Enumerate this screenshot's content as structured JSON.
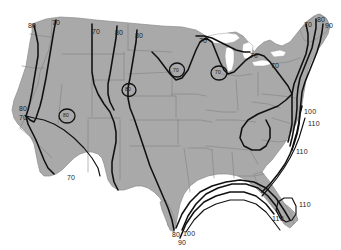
{
  "map": {
    "title": "United States contour map",
    "region": "Contiguous United States",
    "background_color": "#ffffff",
    "land_color": "#a9a9a9",
    "state_border_color": "#7f7f7f",
    "contour_color": "#101010",
    "lake_color": "#ffffff"
  },
  "chart_data": {
    "type": "contour",
    "title": "",
    "xlabel": "",
    "ylabel": "",
    "contour_levels": [
      70,
      80,
      90,
      100,
      110
    ],
    "units": "",
    "legend": [],
    "grid": false,
    "labels": [
      {
        "id": "nw-80",
        "value": "80",
        "x": 28,
        "y": 22,
        "region": "Pacific Northwest coast"
      },
      {
        "id": "nw-70",
        "value": "70",
        "x": 52,
        "y": 19,
        "region": "Washington inland"
      },
      {
        "id": "north-70",
        "value": "70",
        "x": 92,
        "y": 28,
        "region": "Montana"
      },
      {
        "id": "north-80a",
        "value": "80",
        "x": 115,
        "y": 29,
        "region": "Montana east"
      },
      {
        "id": "north-80b",
        "value": "80",
        "x": 135,
        "y": 32,
        "region": "North Dakota"
      },
      {
        "id": "north-70b",
        "value": "70",
        "x": 199,
        "y": 37,
        "region": "Minnesota"
      },
      {
        "id": "greatlakes-70",
        "value": "70",
        "x": 250,
        "y": 52,
        "region": "Great Lakes"
      },
      {
        "id": "northeast-70c",
        "value": "70",
        "x": 271,
        "y": 62,
        "region": "New York / Pennsylvania"
      },
      {
        "id": "ne-corner-70",
        "value": "70",
        "x": 304,
        "y": 21,
        "region": "New England inland"
      },
      {
        "id": "ne-corner-80",
        "value": "80",
        "x": 317,
        "y": 16,
        "region": "New England"
      },
      {
        "id": "ne-corner-90",
        "value": "90",
        "x": 325,
        "y": 22,
        "region": "New England coast"
      },
      {
        "id": "west-80",
        "value": "80",
        "x": 19,
        "y": 105,
        "region": "California coast"
      },
      {
        "id": "west-70",
        "value": "70",
        "x": 19,
        "y": 114,
        "region": "California coast"
      },
      {
        "id": "southwest-70",
        "value": "70",
        "x": 67,
        "y": 174,
        "region": "Arizona / New Mexico"
      },
      {
        "id": "midatl-100",
        "value": "100",
        "x": 304,
        "y": 108,
        "region": "Mid-Atlantic coast"
      },
      {
        "id": "midatl-110a",
        "value": "110",
        "x": 308,
        "y": 120,
        "region": "Mid-Atlantic coast"
      },
      {
        "id": "midatl-110b",
        "value": "110",
        "x": 296,
        "y": 148,
        "region": "Carolina coast"
      },
      {
        "id": "florida-110a",
        "value": "110",
        "x": 299,
        "y": 201,
        "region": "Florida peninsula"
      },
      {
        "id": "florida-110b",
        "value": "110",
        "x": 272,
        "y": 215,
        "region": "Gulf coast Florida"
      },
      {
        "id": "texas-80",
        "value": "80",
        "x": 172,
        "y": 231,
        "region": "South Texas"
      },
      {
        "id": "texas-100",
        "value": "100",
        "x": 183,
        "y": 230,
        "region": "South Texas"
      },
      {
        "id": "texas-90",
        "value": "90",
        "x": 178,
        "y": 239,
        "region": "South Texas"
      }
    ],
    "closed_contours": [
      {
        "id": "nevada-closed",
        "value": "80",
        "x": 67,
        "y": 115,
        "region": "Nevada / Utah"
      },
      {
        "id": "colorado-closed",
        "value": "80",
        "x": 129,
        "y": 89,
        "region": "Colorado / Wyoming"
      },
      {
        "id": "dakota-closed",
        "value": "70",
        "x": 177,
        "y": 70,
        "region": "South Dakota / Nebraska"
      },
      {
        "id": "iowa-closed",
        "value": "70",
        "x": 219,
        "y": 72,
        "region": "Iowa / Wisconsin"
      }
    ]
  }
}
